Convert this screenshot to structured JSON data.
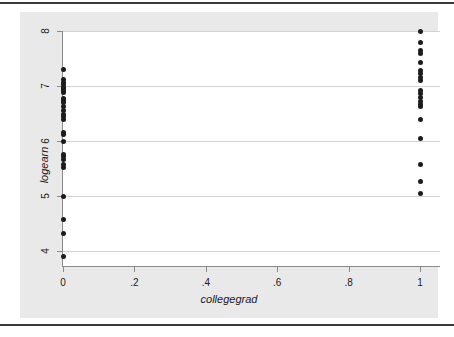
{
  "chart_data": {
    "type": "scatter",
    "title": "",
    "subtitle": "",
    "xlabel": "collegegrad",
    "ylabel": "logearn",
    "xlim": [
      0,
      1
    ],
    "ylim": [
      3.85,
      8.05
    ],
    "grid": "horizontal",
    "legend": "none",
    "x_ticks": [
      0,
      0.2,
      0.4,
      0.6,
      0.8,
      1
    ],
    "x_tick_labels": [
      "0",
      ".2",
      ".4",
      ".6",
      ".8",
      "1"
    ],
    "y_ticks": [
      4,
      5,
      6,
      7,
      8
    ],
    "y_tick_labels": [
      "4",
      "5",
      "6",
      "7",
      "8"
    ],
    "marker_color": "#1c1c1c",
    "gridline_color": "#d3d3d3",
    "axis_color": "#8a8a8a",
    "plot_background": "#ffffff",
    "graph_background": "#e9e9e9",
    "page_background": "#ffffff",
    "series": [
      {
        "name": "collegegrad = 0",
        "x": 0,
        "values": [
          7.3,
          7.12,
          7.07,
          7.02,
          6.98,
          6.95,
          6.92,
          6.88,
          6.78,
          6.74,
          6.7,
          6.62,
          6.55,
          6.48,
          6.44,
          6.4,
          6.16,
          6.12,
          6.0,
          5.76,
          5.71,
          5.66,
          5.58,
          5.52,
          5.0,
          4.58,
          4.32,
          3.9
        ]
      },
      {
        "name": "collegegrad = 1",
        "x": 1,
        "values": [
          8.0,
          7.8,
          7.65,
          7.6,
          7.42,
          7.28,
          7.22,
          7.16,
          7.1,
          6.92,
          6.86,
          6.8,
          6.72,
          6.66,
          6.62,
          6.4,
          6.04,
          5.58,
          5.26,
          5.05
        ]
      }
    ]
  }
}
